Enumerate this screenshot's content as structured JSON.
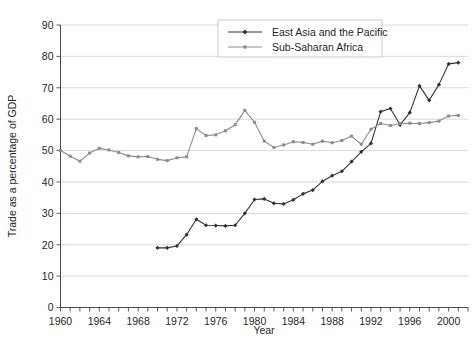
{
  "chart_data": {
    "type": "line",
    "title": "",
    "xlabel": "Year",
    "ylabel": "Trade as a percentage of GDP",
    "xlim": [
      1960,
      2002
    ],
    "ylim": [
      0,
      90
    ],
    "ytick_step": 10,
    "xtick_step": 1,
    "xlabel_step": 4,
    "grid": "horizontal",
    "legend_position": "top-center-right",
    "yticks": [
      0,
      10,
      20,
      30,
      40,
      50,
      60,
      70,
      80,
      90
    ],
    "xticks": [
      1960,
      1964,
      1968,
      1972,
      1976,
      1980,
      1984,
      1988,
      1992,
      1996,
      2000
    ],
    "series": [
      {
        "name": "East Asia and the Pacific",
        "color": "#333333",
        "marker": "filled-diamond",
        "x": [
          1970,
          1971,
          1972,
          1973,
          1974,
          1975,
          1976,
          1977,
          1978,
          1979,
          1980,
          1981,
          1982,
          1983,
          1984,
          1985,
          1986,
          1987,
          1988,
          1989,
          1990,
          1991,
          1992,
          1993,
          1994,
          1995,
          1996,
          1997,
          1998,
          1999,
          2000,
          2001
        ],
        "values": [
          19.0,
          19.0,
          19.6,
          23.2,
          28.1,
          26.2,
          26.1,
          26.0,
          26.2,
          30.0,
          34.4,
          34.6,
          33.2,
          33.0,
          34.3,
          36.2,
          37.4,
          40.2,
          42.0,
          43.4,
          46.5,
          49.6,
          52.3,
          62.4,
          63.4,
          58.2,
          62.1,
          70.6,
          66.0,
          71.0,
          77.6,
          78.0
        ]
      },
      {
        "name": "Sub-Saharan Africa",
        "color": "#8c8c8c",
        "marker": "filled-square",
        "x": [
          1960,
          1961,
          1962,
          1963,
          1964,
          1965,
          1966,
          1967,
          1968,
          1969,
          1970,
          1971,
          1972,
          1973,
          1974,
          1975,
          1976,
          1977,
          1978,
          1979,
          1980,
          1981,
          1982,
          1983,
          1984,
          1985,
          1986,
          1987,
          1988,
          1989,
          1990,
          1991,
          1992,
          1993,
          1994,
          1995,
          1996,
          1997,
          1998,
          1999,
          2000,
          2001
        ],
        "values": [
          50.0,
          48.2,
          46.6,
          49.2,
          50.7,
          50.2,
          49.4,
          48.3,
          48.0,
          48.1,
          47.2,
          46.8,
          47.7,
          48.0,
          57.0,
          54.8,
          55.0,
          56.3,
          58.2,
          62.8,
          59.0,
          53.0,
          51.0,
          51.8,
          52.8,
          52.6,
          52.0,
          53.0,
          52.5,
          53.2,
          54.6,
          52.0,
          56.8,
          58.6,
          58.0,
          58.6,
          58.7,
          58.6,
          58.9,
          59.4,
          61.0,
          61.2
        ]
      }
    ]
  },
  "legend": {
    "entries": [
      {
        "label": "East Asia and the Pacific"
      },
      {
        "label": "Sub-Saharan Africa"
      }
    ]
  },
  "axes": {
    "x_title": "Year",
    "y_title": "Trade as a percentage of GDP"
  }
}
